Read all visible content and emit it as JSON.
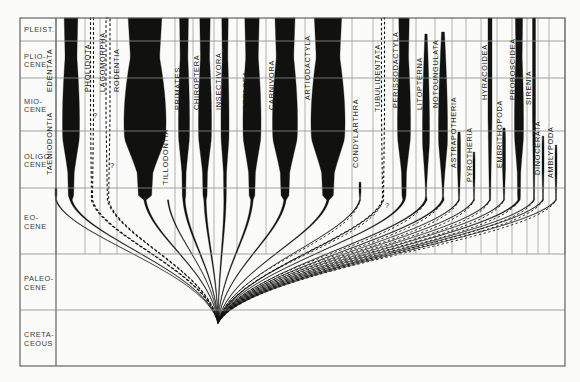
{
  "figure": {
    "name": "mammal-phylogeny-spindle-diagram",
    "background_color": "#fbfbfa",
    "ink_color": "#111110",
    "rule_color": "#8d8d88",
    "frame": {
      "x": 20,
      "y": 18,
      "width": 545,
      "height": 348
    }
  },
  "axis": {
    "name": "geologic-time-scale",
    "label_column_width": 36,
    "epochs": [
      {
        "label_line1": "PLEIST.",
        "label_line2": "",
        "y_top": 18,
        "y_bottom": 41
      },
      {
        "label_line1": "PLIO-",
        "label_line2": "CENE",
        "y_top": 41,
        "y_bottom": 78
      },
      {
        "label_line1": "MIO-",
        "label_line2": "CENE",
        "y_top": 78,
        "y_bottom": 131
      },
      {
        "label_line1": "OLIGO-",
        "label_line2": "CENE",
        "y_top": 131,
        "y_bottom": 188
      },
      {
        "label_line1": "EO-",
        "label_line2": "CENE",
        "y_top": 188,
        "y_bottom": 254
      },
      {
        "label_line1": "PALEO-",
        "label_line2": "CENE",
        "y_top": 254,
        "y_bottom": 310
      },
      {
        "label_line1": "CRETA-",
        "label_line2": "CEOUS",
        "y_top": 310,
        "y_bottom": 366
      }
    ]
  },
  "chart_data": {
    "type": "area",
    "title": "",
    "xlabel": "",
    "ylabel": "Geologic time",
    "legend": "none",
    "grid": true,
    "root": {
      "x": 218,
      "y": 323
    },
    "categories": [
      "TAENIODONTIA",
      "EDENTATA",
      "PHOLIDOTA",
      "LAGOMORPHA",
      "RODENTIA",
      "TILLODONTIA",
      "PRIMATES",
      "CHIROPTERA",
      "INSECTIVORA",
      "CETACEA",
      "CARNIVORA",
      "ARTIODACTYLA",
      "CONDYLARTHRA",
      "TUBULIDENTATA",
      "PERISSODACTYLA",
      "LITOPTERNA",
      "NOTOUNGULATA",
      "ASTRAPOTHERIA",
      "PYROTHERIA",
      "HYRACOIDEA",
      "EMBRITHOPODA",
      "PROBOSCIDEA",
      "SIRENIA",
      "DINOCERATA",
      "AMBLYPODA"
    ],
    "taxa": [
      {
        "name": "TAENIODONTIA",
        "label_x": 52,
        "label_y": 175,
        "axis_x": 56,
        "top_y": 188,
        "style": "line",
        "max_width": 2,
        "reaches_top": false
      },
      {
        "name": "EDENTATA",
        "label_x": 52,
        "label_y": 92,
        "axis_x": 71,
        "top_y": 18,
        "style": "spindle",
        "max_width": 17,
        "reaches_top": true
      },
      {
        "name": "PHOLIDOTA",
        "label_x": 90,
        "label_y": 92,
        "axis_x": 92,
        "top_y": 18,
        "style": "line",
        "max_width": 3,
        "reaches_top": true,
        "uncertain": true
      },
      {
        "name": "LAGOMORPHA",
        "label_x": 105,
        "label_y": 92,
        "axis_x": 108,
        "top_y": 18,
        "style": "line",
        "max_width": 4,
        "reaches_top": true,
        "uncertain": true
      },
      {
        "name": "RODENTIA",
        "label_x": 119,
        "label_y": 92,
        "axis_x": 145,
        "top_y": 18,
        "style": "spindle",
        "max_width": 42,
        "reaches_top": true
      },
      {
        "name": "TILLODONTIA",
        "label_x": 168,
        "label_y": 185,
        "axis_x": 168,
        "top_y": 200,
        "style": "line",
        "max_width": 2,
        "reaches_top": false
      },
      {
        "name": "PRIMATES",
        "label_x": 180,
        "label_y": 110,
        "axis_x": 184,
        "top_y": 18,
        "style": "spindle",
        "max_width": 11,
        "reaches_top": true
      },
      {
        "name": "CHIROPTERA",
        "label_x": 199,
        "label_y": 110,
        "axis_x": 205,
        "top_y": 18,
        "style": "spindle",
        "max_width": 13,
        "reaches_top": true
      },
      {
        "name": "INSECTIVORA",
        "label_x": 221,
        "label_y": 110,
        "axis_x": 225,
        "top_y": 18,
        "style": "spindle",
        "max_width": 8,
        "reaches_top": true
      },
      {
        "name": "CETACEA",
        "label_x": 248,
        "label_y": 110,
        "axis_x": 252,
        "top_y": 18,
        "style": "spindle",
        "max_width": 18,
        "reaches_top": true
      },
      {
        "name": "CARNIVORA",
        "label_x": 274,
        "label_y": 110,
        "axis_x": 285,
        "top_y": 18,
        "style": "spindle",
        "max_width": 25,
        "reaches_top": true
      },
      {
        "name": "ARTIODACTYLA",
        "label_x": 310,
        "label_y": 100,
        "axis_x": 328,
        "top_y": 18,
        "style": "spindle",
        "max_width": 34,
        "reaches_top": true
      },
      {
        "name": "CONDYLARTHRA",
        "label_x": 358,
        "label_y": 168,
        "axis_x": 360,
        "top_y": 182,
        "style": "line",
        "max_width": 2,
        "reaches_top": false
      },
      {
        "name": "TUBULIDENTATA",
        "label_x": 380,
        "label_y": 112,
        "axis_x": 383,
        "top_y": 18,
        "style": "line",
        "max_width": 3,
        "reaches_top": true,
        "uncertain": true
      },
      {
        "name": "PERISSODACTYLA",
        "label_x": 398,
        "label_y": 108,
        "axis_x": 404,
        "top_y": 18,
        "style": "spindle",
        "max_width": 13,
        "reaches_top": true
      },
      {
        "name": "LITOPTERNA",
        "label_x": 422,
        "label_y": 110,
        "axis_x": 426,
        "top_y": 34,
        "style": "spindle",
        "max_width": 7,
        "reaches_top": false
      },
      {
        "name": "NOTOUNGULATA",
        "label_x": 438,
        "label_y": 108,
        "axis_x": 443,
        "top_y": 32,
        "style": "spindle",
        "max_width": 9,
        "reaches_top": false
      },
      {
        "name": "ASTRAPOTHERIA",
        "label_x": 456,
        "label_y": 168,
        "axis_x": 459,
        "top_y": 132,
        "style": "line",
        "max_width": 3,
        "reaches_top": false
      },
      {
        "name": "PYROTHERIA",
        "label_x": 472,
        "label_y": 182,
        "axis_x": 474,
        "top_y": 152,
        "style": "line",
        "max_width": 2,
        "reaches_top": false
      },
      {
        "name": "HYRACOIDEA",
        "label_x": 487,
        "label_y": 100,
        "axis_x": 490,
        "top_y": 18,
        "style": "line",
        "max_width": 4,
        "reaches_top": true
      },
      {
        "name": "EMBRITHOPODA",
        "label_x": 502,
        "label_y": 168,
        "axis_x": 504,
        "top_y": 128,
        "style": "line",
        "max_width": 3,
        "reaches_top": false
      },
      {
        "name": "PROBOSCIDEA",
        "label_x": 515,
        "label_y": 100,
        "axis_x": 519,
        "top_y": 18,
        "style": "spindle",
        "max_width": 9,
        "reaches_top": true
      },
      {
        "name": "SIRENIA",
        "label_x": 531,
        "label_y": 105,
        "axis_x": 534,
        "top_y": 18,
        "style": "line",
        "max_width": 3,
        "reaches_top": true
      },
      {
        "name": "DINOCERATA",
        "label_x": 540,
        "label_y": 175,
        "axis_x": 543,
        "top_y": 136,
        "style": "line",
        "max_width": 2,
        "reaches_top": false
      },
      {
        "name": "AMBLYPODA",
        "label_x": 553,
        "label_y": 178,
        "axis_x": 556,
        "top_y": 145,
        "style": "line",
        "max_width": 2,
        "reaches_top": false
      }
    ],
    "uncertainty_marks": [
      {
        "name": "question-mark-pholidota",
        "x": 93,
        "y": 118
      },
      {
        "name": "question-mark-lagomorpha",
        "x": 110,
        "y": 168
      },
      {
        "name": "question-mark-tubulidentata",
        "x": 385,
        "y": 208
      }
    ],
    "vertical_dividers": [
      56,
      85,
      100,
      117,
      175,
      193,
      214,
      237,
      266,
      305,
      352,
      373,
      393,
      416,
      435,
      452,
      466,
      481,
      497,
      512,
      527,
      538,
      549,
      565
    ]
  }
}
